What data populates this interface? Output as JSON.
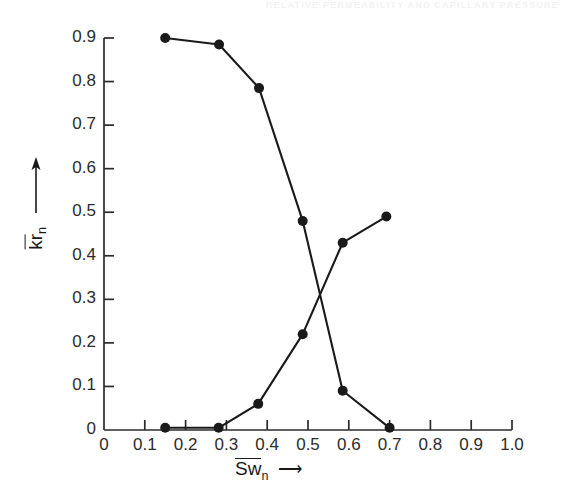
{
  "page_header": "RELATIVE PERMEABILITY AND CAPILLARY PRESSURE",
  "axis": {
    "y_title_main": "kr",
    "y_title_sub": "n",
    "y_title_arrow": "↑",
    "x_title_main": "Sw",
    "x_title_sub": "n",
    "x_title_arrow": "⟶"
  },
  "chart_data": {
    "type": "line",
    "title": "",
    "subtitle": "",
    "xlabel": "Swn",
    "ylabel": "krn",
    "xlim": [
      0,
      1.0
    ],
    "ylim": [
      0,
      0.9
    ],
    "grid": false,
    "legend": "none",
    "x_ticks": [
      "0",
      "0.1",
      "0.2",
      "0.3",
      "0.4",
      "0.5",
      "0.6",
      "0.7",
      "0.8",
      "0.9",
      "1.0"
    ],
    "x_tick_values": [
      0,
      0.1,
      0.2,
      0.3,
      0.4,
      0.5,
      0.6,
      0.7,
      0.8,
      0.9,
      1.0
    ],
    "y_ticks": [
      "0",
      "0.1",
      "0.2",
      "0.3",
      "0.4",
      "0.5",
      "0.6",
      "0.7",
      "0.8",
      "0.9"
    ],
    "y_tick_values": [
      0,
      0.1,
      0.2,
      0.3,
      0.4,
      0.5,
      0.6,
      0.7,
      0.8,
      0.9
    ],
    "marker": "filled-circle",
    "marker_color": "#1a1a1a",
    "line_color": "#1a1a1a",
    "series": [
      {
        "name": "descending",
        "points": [
          [
            0.15,
            0.9
          ],
          [
            0.282,
            0.885
          ],
          [
            0.38,
            0.785
          ],
          [
            0.487,
            0.48
          ],
          [
            0.585,
            0.09
          ],
          [
            0.7,
            0.005
          ]
        ]
      },
      {
        "name": "ascending",
        "points": [
          [
            0.15,
            0.005
          ],
          [
            0.281,
            0.005
          ],
          [
            0.378,
            0.06
          ],
          [
            0.487,
            0.22
          ],
          [
            0.585,
            0.43
          ],
          [
            0.692,
            0.49
          ]
        ]
      }
    ]
  }
}
